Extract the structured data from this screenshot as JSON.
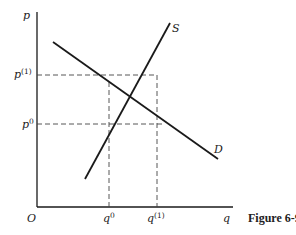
{
  "figure": {
    "caption": "Figure 6-9",
    "axes": {
      "y_label": "p",
      "x_label": "q",
      "origin_label": "O"
    },
    "curves": {
      "supply_label": "S",
      "demand_label": "D"
    },
    "price_levels": [
      {
        "base": "p",
        "sup": "(1)"
      },
      {
        "base": "p",
        "sup": "0"
      }
    ],
    "quantity_levels": [
      {
        "base": "q",
        "sup": "0"
      },
      {
        "base": "q",
        "sup": "(1)"
      }
    ],
    "colors": {
      "line": "#1a1a1a",
      "dashed": "#444444",
      "background": "#ffffff"
    }
  }
}
